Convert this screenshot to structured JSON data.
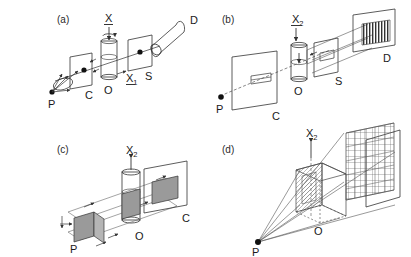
{
  "figure": {
    "background_color": "#ffffff",
    "line_color": "#333333",
    "fill_gray": "#9a9a9a",
    "fill_light": "#e8e8e8",
    "caption_style": "parenthesized lowercase letters"
  },
  "panels": [
    {
      "id": "a",
      "label": "(a)",
      "axis_label": "X",
      "axis_underlined": true,
      "elements": [
        {
          "name": "point-source",
          "label": "P"
        },
        {
          "name": "collimator-plane",
          "label": "C"
        },
        {
          "name": "object-cylinder",
          "label": "O"
        },
        {
          "name": "slit-plane",
          "label": "S"
        },
        {
          "name": "detector-cylinder",
          "label": "D"
        },
        {
          "name": "secondary-axis",
          "label": "X",
          "subscript": "1",
          "underlined": true
        }
      ]
    },
    {
      "id": "b",
      "label": "(b)",
      "axis_label": "X",
      "axis_subscript": "2",
      "axis_underlined": true,
      "elements": [
        {
          "name": "point-source",
          "label": "P"
        },
        {
          "name": "collimator-plane",
          "label": "C"
        },
        {
          "name": "object-cylinder",
          "label": "O"
        },
        {
          "name": "slit-plane",
          "label": "S"
        },
        {
          "name": "detector-grating",
          "label": "D"
        }
      ]
    },
    {
      "id": "c",
      "label": "(c)",
      "axis_label": "X",
      "axis_subscript": "2",
      "axis_underlined": false,
      "elements": [
        {
          "name": "point-source",
          "label": "P"
        },
        {
          "name": "object-cylinder",
          "label": "O"
        },
        {
          "name": "collimator-plane",
          "label": "C"
        }
      ]
    },
    {
      "id": "d",
      "label": "(d)",
      "axis_label": "X",
      "axis_subscript": "2",
      "axis_underlined": false,
      "elements": [
        {
          "name": "point-source",
          "label": "P"
        },
        {
          "name": "object-box",
          "label": "O"
        }
      ]
    }
  ],
  "labels": {
    "panel_a": "(a)",
    "panel_b": "(b)",
    "panel_c": "(c)",
    "panel_d": "(d)",
    "P": "P",
    "C": "C",
    "O": "O",
    "S": "S",
    "D": "D",
    "X": "X",
    "sub1": "1",
    "sub2": "2"
  }
}
